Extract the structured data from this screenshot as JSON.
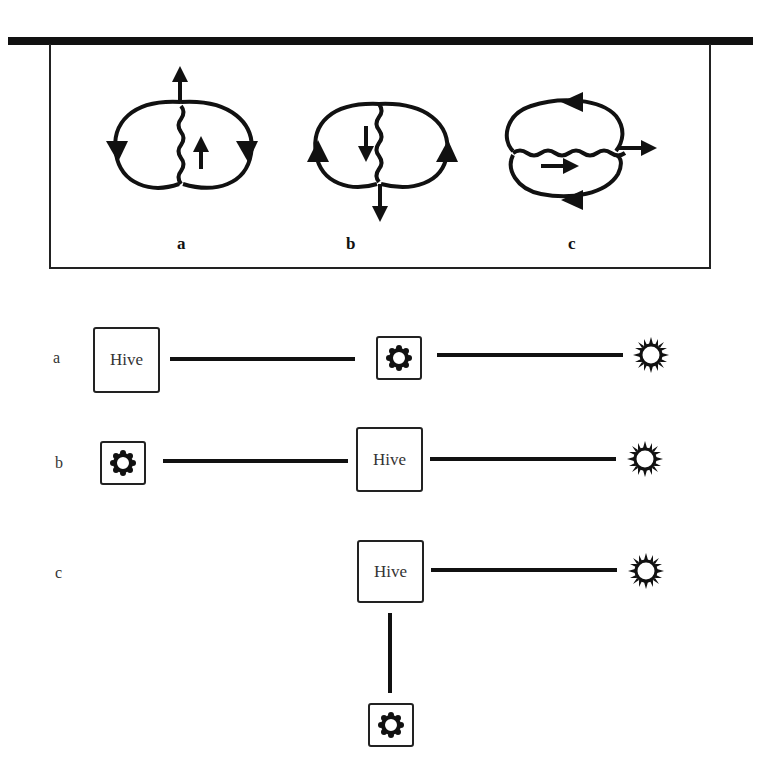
{
  "figure_top": {
    "diagrams": [
      {
        "label": "a",
        "description": "Two lobes, wavy line vertical, arrows up (straight run upward)"
      },
      {
        "label": "b",
        "description": "Two lobes, wavy line vertical, arrows down (straight run downward)"
      },
      {
        "label": "c",
        "description": "Two lobes stacked, wavy line horizontal, arrows right (straight run to the right)"
      }
    ]
  },
  "figure_bottom": {
    "rows": [
      {
        "label": "a",
        "hive_label": "Hive"
      },
      {
        "label": "b",
        "hive_label": "Hive"
      },
      {
        "label": "c",
        "hive_label": "Hive"
      }
    ],
    "icons": {
      "food_source": "flower-icon",
      "sun": "sun-icon"
    }
  }
}
